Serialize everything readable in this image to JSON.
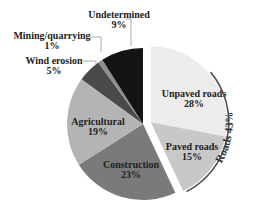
{
  "chart_data": {
    "type": "pie",
    "title": "",
    "slices": [
      {
        "label": "Unpaved roads",
        "value": 28,
        "display": "28%",
        "color": "#ececec",
        "group": "Roads",
        "exploded": true
      },
      {
        "label": "Paved roads",
        "value": 15,
        "display": "15%",
        "color": "#c8c8c8",
        "group": "Roads",
        "exploded": true
      },
      {
        "label": "Construction",
        "value": 23,
        "display": "23%",
        "color": "#7a7a7a",
        "exploded": false
      },
      {
        "label": "Agricultural",
        "value": 19,
        "display": "19%",
        "color": "#b4b4b4",
        "exploded": false
      },
      {
        "label": "Wind erosion",
        "value": 5,
        "display": "5%",
        "color": "#4a4a4a",
        "exploded": false
      },
      {
        "label": "Mining/quarrying",
        "value": 1,
        "display": "1%",
        "color": "#8e8e8e",
        "exploded": false
      },
      {
        "label": "Undetermined",
        "value": 9,
        "display": "9%",
        "color": "#141414",
        "exploded": false
      }
    ],
    "groups": [
      {
        "label": "Roads",
        "value": 43,
        "display": "43%",
        "members": [
          "Unpaved roads",
          "Paved roads"
        ]
      }
    ],
    "start_angle": "12 o'clock",
    "direction": "clockwise",
    "legend": "none (direct labels)"
  }
}
